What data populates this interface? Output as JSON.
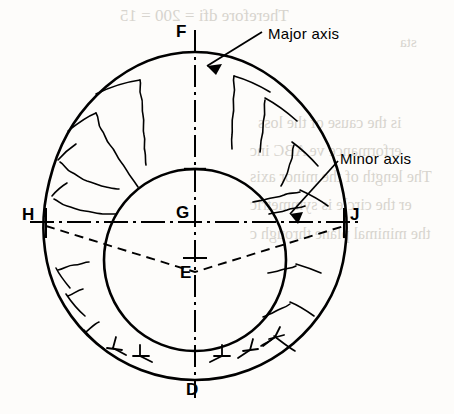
{
  "figure": {
    "type": "engineering-fracture-diagram",
    "background_color": "#fdfcfa",
    "line_color": "#000000"
  },
  "callouts": [
    {
      "id": "major-axis",
      "label": "Major axis",
      "x": 268,
      "y": 25
    },
    {
      "id": "minor-axis",
      "label": "Minor axis",
      "x": 340,
      "y": 150
    }
  ],
  "points": [
    {
      "id": "F",
      "label": "F",
      "x": 176,
      "y": 22
    },
    {
      "id": "H",
      "label": "H",
      "x": 22,
      "y": 205
    },
    {
      "id": "G",
      "label": "G",
      "x": 176,
      "y": 203
    },
    {
      "id": "J",
      "label": "J",
      "x": 350,
      "y": 205
    },
    {
      "id": "E",
      "label": "E",
      "x": 180,
      "y": 263
    },
    {
      "id": "D",
      "label": "D",
      "x": 186,
      "y": 380
    }
  ],
  "ghost_text": [
    {
      "text": "Therefore  dfi = 200 = 15",
      "x": 120,
      "y": 6,
      "size": 17
    },
    {
      "text": "sta",
      "x": 400,
      "y": 34,
      "size": 15
    },
    {
      "text": "is the cause of the loss",
      "x": 258,
      "y": 114,
      "size": 16
    },
    {
      "text": "erformance ve ABC inc",
      "x": 250,
      "y": 142,
      "size": 16
    },
    {
      "text": "The length of the minor axis",
      "x": 250,
      "y": 168,
      "size": 16
    },
    {
      "text": "er the circle is symmetric",
      "x": 250,
      "y": 196,
      "size": 16
    },
    {
      "text": "the minimal plane through c",
      "x": 250,
      "y": 225,
      "size": 16
    }
  ],
  "geometry": {
    "outer_oval": {
      "cx": 195,
      "cy": 216,
      "rx": 150,
      "ry": 164
    },
    "inner_circle": {
      "cx": 195,
      "cy": 260,
      "r": 91
    },
    "major_axis": {
      "x1": 195,
      "y1": 30,
      "x2": 195,
      "y2": 398,
      "style": "dash-dot"
    },
    "minor_axis": {
      "x1": 30,
      "y1": 222,
      "x2": 360,
      "y2": 222,
      "style": "dash-dot"
    },
    "chord_H_E": {
      "x1": 46,
      "y1": 224,
      "x2": 195,
      "y2": 272,
      "style": "dashed"
    },
    "chord_E_J": {
      "x1": 195,
      "y1": 272,
      "x2": 344,
      "y2": 224,
      "style": "dashed"
    }
  },
  "colors": {
    "ink": "#000000",
    "paper": "#fdfcfa",
    "ghost": "#b9b4ab"
  }
}
